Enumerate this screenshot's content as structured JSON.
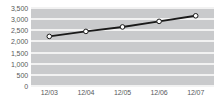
{
  "chart_data": {
    "type": "line",
    "title": "",
    "xlabel": "",
    "ylabel": "",
    "categories": [
      "12/03",
      "12/04",
      "12/05",
      "12/06",
      "12/07"
    ],
    "values": [
      2225,
      2450,
      2650,
      2900,
      3150
    ],
    "series": [
      {
        "name": "",
        "values": [
          2225,
          2450,
          2650,
          2900,
          3150
        ]
      }
    ],
    "ylim": [
      0,
      3500
    ],
    "y_ticks": [
      0,
      500,
      1000,
      1500,
      2000,
      2500,
      3000,
      3500
    ],
    "y_tick_labels": [
      "0",
      "500",
      "1,000",
      "1,500",
      "2,000",
      "2,500",
      "3,000",
      "3,500"
    ],
    "x_tick_labels": [
      "12/03",
      "12/04",
      "12/05",
      "12/06",
      "12/07"
    ],
    "grid": true,
    "grid_orientation": "horizontal",
    "legend": false,
    "legend_position": "none",
    "marker": "circle",
    "colors": {
      "plot_background": "#c9cacc",
      "gridline": "#f2f2f2",
      "line": "#1a1a1a",
      "marker_fill": "#ffffff",
      "marker_stroke": "#1a1a1a",
      "tick_label": "#58595b",
      "page_background": "#ffffff"
    }
  }
}
